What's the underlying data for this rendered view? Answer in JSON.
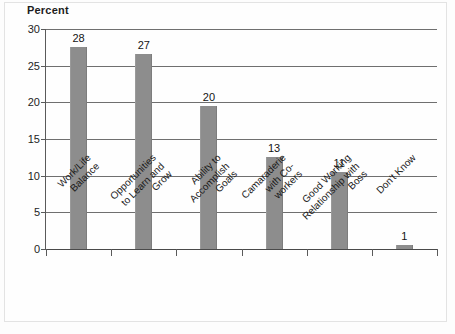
{
  "chart_data": {
    "type": "bar",
    "title": "",
    "ylabel": "Percent",
    "xlabel": "",
    "ylim": [
      0,
      30
    ],
    "yticks": [
      0,
      5,
      10,
      15,
      20,
      25,
      30
    ],
    "ytick_labels": [
      "0",
      "5",
      "10",
      "15",
      "20",
      "25",
      "30"
    ],
    "grid": true,
    "legend": "none",
    "categories": [
      "Work/Life\nBalance",
      "Opportunities\nto Learn and\nGrow",
      "Ability to\nAccomplish\nGoals",
      "Camaraderie\nwith Co-\nworkers",
      "Good Working\nRelationship with\nBoss",
      "Don't Know"
    ],
    "values": [
      28,
      27,
      20,
      13,
      11,
      1
    ],
    "value_labels": [
      "28",
      "27",
      "20",
      "13",
      "11",
      "1"
    ],
    "bar_color": "#8d8d8d",
    "axis_color": "#4a4a4a",
    "grid_color": "#6f6f6f"
  }
}
